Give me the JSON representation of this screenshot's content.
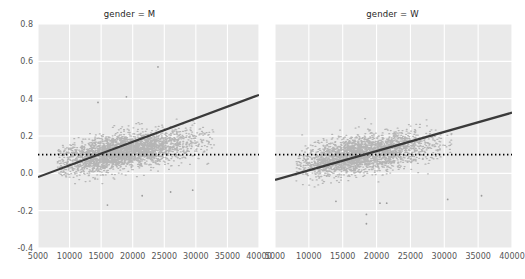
{
  "figure": {
    "width": 522,
    "height": 279,
    "background": "#ffffff",
    "axes_facecolor": "#eaeaea",
    "grid_color": "#ffffff",
    "point_color": "#808080",
    "line_color": "#3a3a3a",
    "refline_color": "#000000",
    "tick_color": "#555555"
  },
  "chart_data": {
    "type": "scatter",
    "title": "",
    "xlabel": "",
    "ylabel": "",
    "xlim": [
      5000,
      40000
    ],
    "ylim": [
      -0.4,
      0.8
    ],
    "grid": true,
    "legend": "none",
    "facet_variable": "gender",
    "xticks": [
      5000,
      10000,
      15000,
      20000,
      25000,
      30000,
      35000,
      40000
    ],
    "xticklabels": [
      "5000",
      "10000",
      "15000",
      "20000",
      "25000",
      "30000",
      "35000",
      "40000"
    ],
    "yticks": [
      -0.4,
      -0.2,
      0.0,
      0.2,
      0.4,
      0.6,
      0.8
    ],
    "yticklabels": [
      "-0.4",
      "-0.2",
      "0.0",
      "0.2",
      "0.4",
      "0.6",
      "0.8"
    ],
    "panels": [
      {
        "title": "gender = M",
        "facet_value": "M",
        "regression_line": {
          "x": [
            5000,
            40000
          ],
          "y": [
            -0.02,
            0.42
          ],
          "slope": 1.26e-05,
          "intercept": -0.083,
          "style": "solid"
        },
        "reference_line": {
          "y": 0.1,
          "style": "dotted",
          "x": [
            5000,
            40000
          ]
        },
        "cluster": {
          "x_center": 18000,
          "y_center": 0.115,
          "x_spread": 4800,
          "y_spread": 0.055,
          "correlation": 0.55,
          "n_points": 3000,
          "x_min": 8000,
          "x_max": 33000,
          "y_min": -0.07,
          "y_max": 0.36
        },
        "outliers": [
          {
            "x": 24000,
            "y": 0.57
          },
          {
            "x": 19000,
            "y": 0.41
          },
          {
            "x": 14500,
            "y": 0.38
          },
          {
            "x": 16000,
            "y": -0.17
          },
          {
            "x": 26000,
            "y": -0.1
          },
          {
            "x": 21500,
            "y": -0.12
          },
          {
            "x": 29500,
            "y": -0.09
          }
        ]
      },
      {
        "title": "gender = W",
        "facet_value": "W",
        "regression_line": {
          "x": [
            5000,
            40000
          ],
          "y": [
            -0.035,
            0.325
          ],
          "slope": 1.03e-05,
          "intercept": -0.0865,
          "style": "solid"
        },
        "reference_line": {
          "y": 0.1,
          "style": "dotted",
          "x": [
            5000,
            40000
          ]
        },
        "cluster": {
          "x_center": 17500,
          "y_center": 0.1,
          "x_spread": 4300,
          "y_spread": 0.055,
          "correlation": 0.48,
          "n_points": 2600,
          "x_min": 8000,
          "x_max": 31000,
          "y_min": -0.09,
          "y_max": 0.32
        },
        "outliers": [
          {
            "x": 18500,
            "y": -0.22
          },
          {
            "x": 18500,
            "y": -0.27
          },
          {
            "x": 14000,
            "y": -0.15
          },
          {
            "x": 20500,
            "y": -0.16
          },
          {
            "x": 21500,
            "y": -0.16
          },
          {
            "x": 30500,
            "y": -0.14
          },
          {
            "x": 35500,
            "y": -0.12
          }
        ]
      }
    ]
  }
}
